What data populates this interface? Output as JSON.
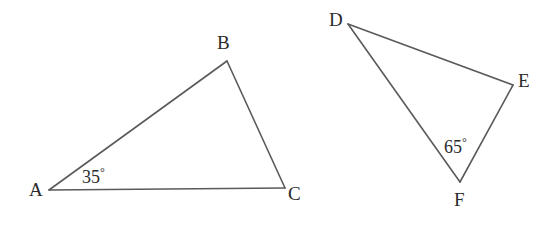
{
  "figure": {
    "background_color": "#ffffff",
    "stroke_color": "#5a5a5a",
    "text_color": "#2b2b2b",
    "width": 551,
    "height": 232
  },
  "triangles": [
    {
      "name": "triangle-abc",
      "vertices": [
        {
          "label": "A",
          "x": 49,
          "y": 190,
          "label_x": 37,
          "label_y": 189
        },
        {
          "label": "B",
          "x": 227,
          "y": 61,
          "label_x": 225,
          "label_y": 42
        },
        {
          "label": "C",
          "x": 285,
          "y": 188,
          "label_x": 296,
          "label_y": 193
        }
      ],
      "angle_marks": [
        {
          "at_vertex": "A",
          "value": "35",
          "degree_symbol": "°",
          "text": "35°",
          "label_x": 100,
          "label_y": 175
        }
      ]
    },
    {
      "name": "triangle-def",
      "vertices": [
        {
          "label": "D",
          "x": 348,
          "y": 24,
          "label_x": 337,
          "label_y": 19
        },
        {
          "label": "E",
          "x": 513,
          "y": 85,
          "label_x": 526,
          "label_y": 80
        },
        {
          "label": "F",
          "x": 460,
          "y": 182,
          "label_x": 461,
          "label_y": 199
        }
      ],
      "angle_marks": [
        {
          "at_vertex": "F",
          "value": "65",
          "degree_symbol": "°",
          "text": "65°",
          "label_x": 462,
          "label_y": 145
        }
      ]
    }
  ],
  "labels": {
    "a": "A",
    "b": "B",
    "c": "C",
    "d": "D",
    "e": "E",
    "f": "F",
    "angle_a_value": "35",
    "angle_f_value": "65",
    "degree": "°"
  }
}
